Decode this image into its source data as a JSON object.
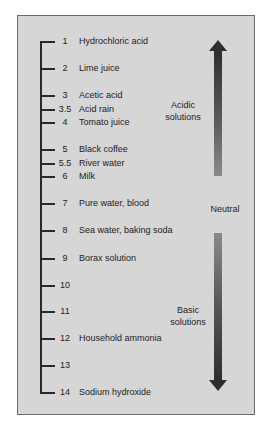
{
  "figure": {
    "scale": [
      {
        "value": "1",
        "y": 41,
        "label": "Hydrochloric acid"
      },
      {
        "value": "2",
        "y": 68,
        "label": "Lime juice"
      },
      {
        "value": "3",
        "y": 95,
        "label": "Acetic acid"
      },
      {
        "value": "3.5",
        "y": 109,
        "label": "Acid rain"
      },
      {
        "value": "4",
        "y": 122,
        "label": "Tomato juice"
      },
      {
        "value": "5",
        "y": 149,
        "label": "Black coffee"
      },
      {
        "value": "5.5",
        "y": 163,
        "label": "River water"
      },
      {
        "value": "6",
        "y": 176,
        "label": "Milk"
      },
      {
        "value": "7",
        "y": 203,
        "label": "Pure water, blood"
      },
      {
        "value": "8",
        "y": 230,
        "label": "Sea water, baking soda"
      },
      {
        "value": "9",
        "y": 258,
        "label": "Borax solution"
      },
      {
        "value": "10",
        "y": 285,
        "label": ""
      },
      {
        "value": "11",
        "y": 311,
        "label": ""
      },
      {
        "value": "12",
        "y": 338,
        "label": "Household ammonia"
      },
      {
        "value": "13",
        "y": 365,
        "label": ""
      },
      {
        "value": "14",
        "y": 392,
        "label": "Sodium hydroxide"
      }
    ],
    "regions": {
      "acidic": {
        "line1": "Acidic",
        "line2": "solutions"
      },
      "neutral": {
        "label": "Neutral"
      },
      "basic": {
        "line1": "Basic",
        "line2": "solutions"
      }
    },
    "colors": {
      "background": "#d6d6d6",
      "border": "#6a6a6a",
      "arrow_dark": "#2e2e2e",
      "arrow_light": "#8a8a8a"
    }
  }
}
